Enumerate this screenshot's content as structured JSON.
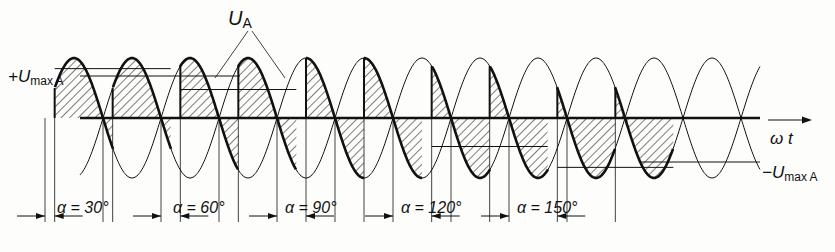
{
  "diagram": {
    "title_label": "U",
    "title_sub": "A",
    "axis_label": "ω t",
    "pos_max_label": {
      "prefix": "+U",
      "sub": "max A"
    },
    "neg_max_label": {
      "prefix": "−U",
      "sub": "max A"
    },
    "colors": {
      "ink": "#111111",
      "background": "#fdfdfb"
    },
    "geometry": {
      "x_start": 80,
      "x_end": 760,
      "zero_y": 118,
      "amplitude": 60,
      "half_period_px": 58,
      "first_peak_x": 132
    },
    "segments": [
      {
        "alpha_label": "α = 30°",
        "alpha_deg": 30,
        "mean_level": 0.866
      },
      {
        "alpha_label": "α = 60°",
        "alpha_deg": 60,
        "mean_level": 0.5
      },
      {
        "alpha_label": "α = 90°",
        "alpha_deg": 90,
        "mean_level": 0.0
      },
      {
        "alpha_label": "α = 120°",
        "alpha_deg": 120,
        "mean_level": -0.5
      },
      {
        "alpha_label": "α = 150°",
        "alpha_deg": 150,
        "mean_level": -0.866
      }
    ]
  }
}
